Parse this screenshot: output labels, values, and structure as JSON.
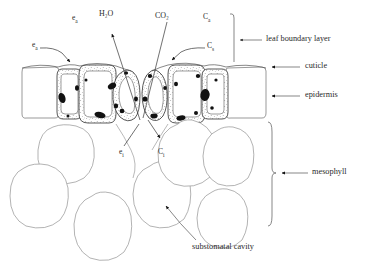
{
  "figure": {
    "ink_color": "#2a2a2a",
    "cell_outline_color": "#6e6e6e",
    "background": "#ffffff"
  },
  "flux_labels": {
    "water_vapour_out": "H₂O",
    "carbon_dioxide_in": "CO₂"
  },
  "concentration_labels": {
    "e_a": {
      "base": "e",
      "sub": "a"
    },
    "e_a2": {
      "base": "e",
      "sub": "a"
    },
    "e_i": {
      "base": "e",
      "sub": "i"
    },
    "C_a": {
      "base": "C",
      "sub": "a"
    },
    "C_s": {
      "base": "C",
      "sub": "s"
    },
    "C_i": {
      "base": "C",
      "sub": "i"
    }
  },
  "annotations": [
    {
      "id": "leaf-boundary-layer",
      "label": "leaf boundary layer"
    },
    {
      "id": "cuticle",
      "label": "cuticle"
    },
    {
      "id": "epidermis",
      "label": "epidermis"
    },
    {
      "id": "mesophyll",
      "label": "mesophyll"
    },
    {
      "id": "substomatal-cavity",
      "label": "substomatal cavity"
    }
  ]
}
